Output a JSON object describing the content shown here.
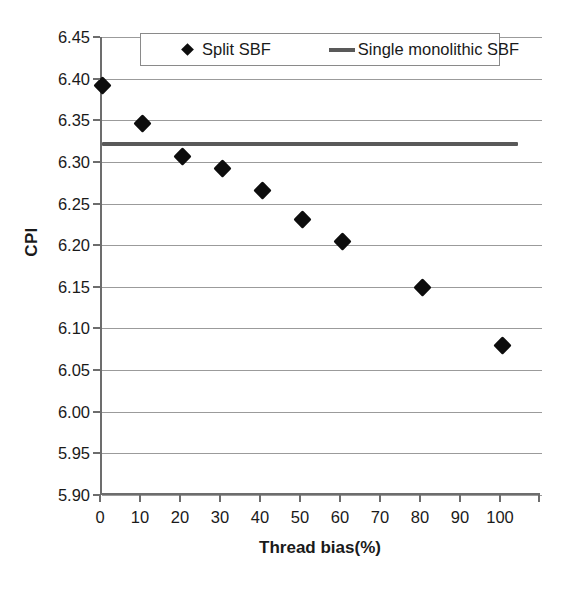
{
  "chart_data": {
    "type": "scatter",
    "title": "",
    "xlabel": "Thread bias(%)",
    "ylabel": "CPI",
    "xlim": [
      0,
      110
    ],
    "ylim": [
      5.9,
      6.45
    ],
    "xticks": [
      "0",
      "10",
      "20",
      "30",
      "40",
      "50",
      "60",
      "70",
      "80",
      "90",
      "100"
    ],
    "xtick_values": [
      0,
      10,
      20,
      30,
      40,
      50,
      60,
      70,
      80,
      90,
      100
    ],
    "yticks": [
      "5.90",
      "5.95",
      "6.00",
      "6.05",
      "6.10",
      "6.15",
      "6.20",
      "6.25",
      "6.30",
      "6.35",
      "6.40",
      "6.45"
    ],
    "ytick_values": [
      5.9,
      5.95,
      6.0,
      6.05,
      6.1,
      6.15,
      6.2,
      6.25,
      6.3,
      6.35,
      6.4,
      6.45
    ],
    "grid": "horizontal",
    "legend_position": "top-inside",
    "series": [
      {
        "name": "Split SBF",
        "marker": "diamond",
        "color": "#0d0d0d",
        "x": [
          0,
          10,
          20,
          30,
          40,
          50,
          60,
          80,
          100
        ],
        "values": [
          6.392,
          6.346,
          6.307,
          6.292,
          6.266,
          6.231,
          6.204,
          6.149,
          6.08
        ]
      },
      {
        "name": "Single monolithic SBF",
        "marker": "line",
        "color": "#595959",
        "constant_value": 6.322,
        "x_start": 0,
        "x_end": 104
      }
    ]
  },
  "legend": {
    "entries": [
      {
        "label": "Split SBF",
        "marker": "diamond"
      },
      {
        "label": "Single monolithic SBF",
        "marker": "line"
      }
    ]
  }
}
